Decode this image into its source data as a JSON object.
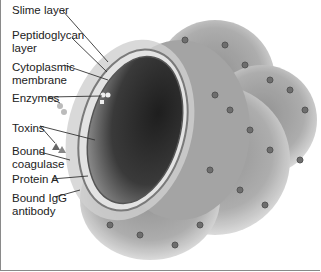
{
  "diagram": {
    "labels": [
      {
        "id": "slime-layer",
        "text": "Slime layer"
      },
      {
        "id": "peptidoglycan-layer",
        "text": "Peptidoglycan\nlayer"
      },
      {
        "id": "cytoplasmic-membrane",
        "text": "Cytoplasmic\nmembrane"
      },
      {
        "id": "enzymes",
        "text": "Enzymes"
      },
      {
        "id": "toxins",
        "text": "Toxins"
      },
      {
        "id": "bound-coagulase",
        "text": "Bound\ncoagulase"
      },
      {
        "id": "protein-a",
        "text": "Protein A"
      },
      {
        "id": "bound-igg-antibody",
        "text": "Bound IgG\nantibody"
      }
    ],
    "colors": {
      "cytoplasm": "#2e2e2e",
      "cell_wall": "#9a9a9a",
      "slime": "#bdbdbd",
      "leader_line": "#333333"
    }
  }
}
